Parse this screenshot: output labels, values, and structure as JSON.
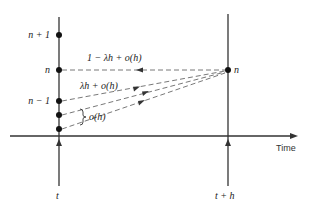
{
  "diagram": {
    "type": "state-transition-timeline",
    "axis_label": "Time",
    "time_labels": {
      "left": "t",
      "right": "t + h"
    },
    "left_state_labels": [
      "n + 1",
      "n",
      "n − 1"
    ],
    "right_state_label": "n",
    "transitions": [
      {
        "from": "n",
        "to": "n",
        "label": "1 − λh + o(h)"
      },
      {
        "from": "n − 1",
        "to": "n",
        "label": "λh + o(h)"
      },
      {
        "from": "n − 2",
        "to": "n",
        "label": ""
      },
      {
        "from": "n − 3",
        "to": "n",
        "label": ""
      }
    ],
    "brace_label": "o(h)",
    "colors": {
      "line": "#333333",
      "dashed": "#555555",
      "dot": "#111111",
      "background": "#ffffff"
    }
  }
}
